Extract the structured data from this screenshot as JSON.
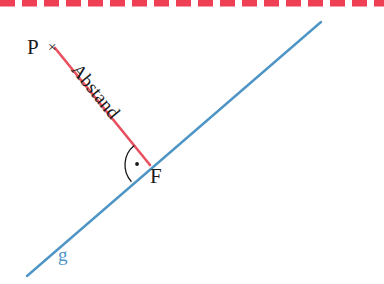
{
  "figure": {
    "width": 384,
    "height": 284,
    "background": "#ffffff"
  },
  "colors": {
    "red_line": "#e8505f",
    "red_dashed_border": "#ee3f55",
    "blue_line": "#4e95c6",
    "label_dark": "#1a1a1a",
    "blue_label": "#4e95c6",
    "arc_dark": "#1a1a1a"
  },
  "border": {
    "name": "dashed-top-border",
    "color": "#ee3f55",
    "dash_length": 15,
    "gap_length": 7,
    "thickness": 7,
    "y": 3
  },
  "lines": {
    "line_g": {
      "label": "g",
      "color": "#4e95c6",
      "thickness": 2.4,
      "x1": 27,
      "y1": 276,
      "x2": 321,
      "y2": 22
    },
    "distance_segment": {
      "label": "Abstand",
      "color": "#e8505f",
      "thickness": 2.6,
      "x1": 55,
      "y1": 48,
      "x2": 150,
      "y2": 165
    }
  },
  "points": {
    "P": {
      "label": "P",
      "marker": "×",
      "x": 55,
      "y": 48
    },
    "F": {
      "label": "F",
      "x": 150,
      "y": 165
    }
  },
  "right_angle": {
    "name": "right-angle-arc",
    "symbol_dot": "·",
    "radius": 25,
    "color": "#1a1a1a"
  },
  "labels": {
    "point_p": "P",
    "point_p_marker": "×",
    "distance": "Abstand",
    "foot_point": "F",
    "line_g": "g"
  }
}
